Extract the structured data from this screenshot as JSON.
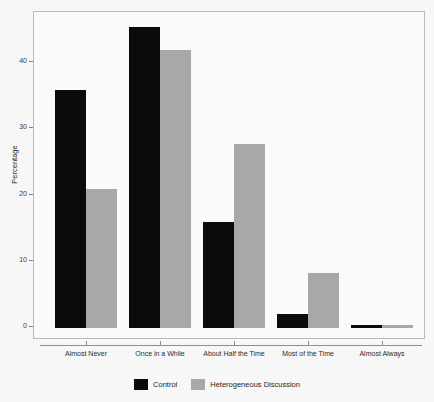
{
  "chart_data": {
    "type": "bar",
    "title": "",
    "subtitle": "",
    "xlabel": "",
    "ylabel": "Percentage",
    "ylim": [
      0,
      46
    ],
    "yticks": [
      0,
      10,
      20,
      30,
      40
    ],
    "ytick_labels": [
      "0",
      "10",
      "20",
      "30",
      "40"
    ],
    "grid": false,
    "legend_position": "bottom",
    "categories": [
      "Almost Never",
      "Once in a While",
      "About Half the Time",
      "Most of the Time",
      "Almost Always"
    ],
    "series": [
      {
        "name": "Control",
        "color": "#0b0b0b",
        "values": [
          36.0,
          45.5,
          16.0,
          2.1,
          0.5
        ]
      },
      {
        "name": "Heterogeneous Discussion",
        "color": "#a8a8a8",
        "values": [
          21.0,
          42.0,
          27.8,
          8.3,
          0.5
        ]
      }
    ]
  },
  "figure": {
    "background_color": "#f7f7f7",
    "panel_color": "#fafafa",
    "frame_color": "#b9b9b9",
    "axis_color": "#8e8e8e"
  }
}
